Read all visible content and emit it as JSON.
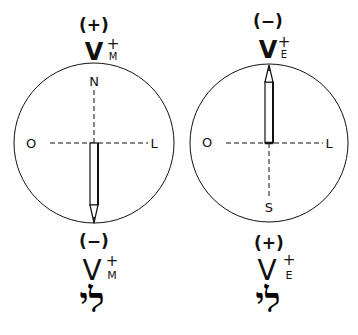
{
  "diagram": {
    "type": "compass-needle-deflection",
    "panels": [
      {
        "id": "left",
        "top_sign": "(+)",
        "top_symbol": "V",
        "top_superscript": "+",
        "top_subscript": "M",
        "compass_labels": {
          "north": "N",
          "west": "O",
          "east": "L"
        },
        "needle_direction": "south",
        "bottom_sign": "(−)",
        "bottom_symbol": "V",
        "bottom_superscript": "+",
        "bottom_subscript": "M",
        "bottom_glyph": "לי"
      },
      {
        "id": "right",
        "top_sign": "(−)",
        "top_symbol": "V",
        "top_superscript": "+",
        "top_subscript": "E",
        "compass_labels": {
          "south": "S",
          "west": "O",
          "east": "L"
        },
        "needle_direction": "north",
        "bottom_sign": "(+)",
        "bottom_symbol": "V",
        "bottom_superscript": "+",
        "bottom_subscript": "E",
        "bottom_glyph": "לי"
      }
    ],
    "colors": {
      "ink": "#111111",
      "background": "#ffffff"
    }
  }
}
